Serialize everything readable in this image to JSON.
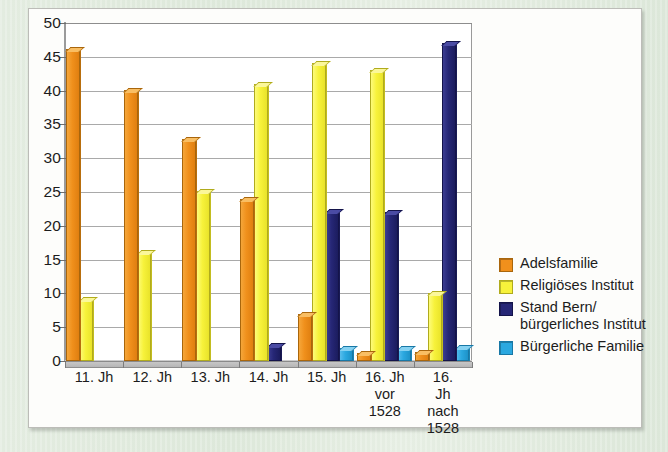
{
  "chart_data": {
    "type": "bar",
    "title": "",
    "xlabel": "",
    "ylabel": "",
    "ylim": [
      0,
      50
    ],
    "yticks": [
      0,
      5,
      10,
      15,
      20,
      25,
      30,
      35,
      40,
      45,
      50
    ],
    "grid": true,
    "legend_position": "right",
    "categories": [
      "11. Jh",
      "12. Jh",
      "13. Jh",
      "14. Jh",
      "15. Jh",
      "16. Jh\nvor\n1528",
      "16. Jh\nnach\n1528"
    ],
    "series": [
      {
        "name": "Adelsfamilie",
        "color": "#f0901c",
        "values": [
          45.8,
          39.8,
          32.5,
          23.7,
          6.7,
          0.9,
          1.0
        ]
      },
      {
        "name": "Religiöses Institut",
        "color": "#f7f23b",
        "values": [
          8.9,
          15.8,
          24.9,
          40.7,
          43.8,
          42.8,
          9.7
        ]
      },
      {
        "name": "Stand Bern/\nbürgerliches Institut",
        "color": "#262776",
        "values": [
          0,
          0,
          0,
          2.0,
          21.9,
          21.8,
          46.7
        ]
      },
      {
        "name": "Bürgerliche Familie",
        "color": "#2ba8e0",
        "values": [
          0,
          0,
          0,
          0,
          1.7,
          1.7,
          1.8
        ]
      }
    ]
  },
  "legend": {
    "items": [
      {
        "label": "Adelsfamilie"
      },
      {
        "label": "Religiöses Institut"
      },
      {
        "label": "Stand Bern/\nbürgerliches Institut"
      },
      {
        "label": "Bürgerliche Familie"
      }
    ]
  }
}
